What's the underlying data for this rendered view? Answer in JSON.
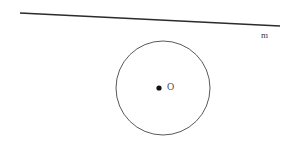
{
  "figure": {
    "kind": "geometry-diagram",
    "background_color": "#ffffff",
    "width": 288,
    "height": 143,
    "labels": {
      "line_label": "m",
      "center_label": "O"
    },
    "colors": {
      "line_stroke": "#2b2b2b",
      "circle_stroke": "#5a5a5a",
      "center_dot_fill": "#111111",
      "label_text": "#3b3b3b"
    },
    "geometry": {
      "line": {
        "x1": 20,
        "y1": 13,
        "x2": 280,
        "y2": 26,
        "stroke_width": 1.6
      },
      "circle": {
        "cx": 163,
        "cy": 88,
        "r": 47,
        "stroke_width": 1
      },
      "center_dot": {
        "cx": 159,
        "cy": 88,
        "r": 2.6
      }
    }
  }
}
